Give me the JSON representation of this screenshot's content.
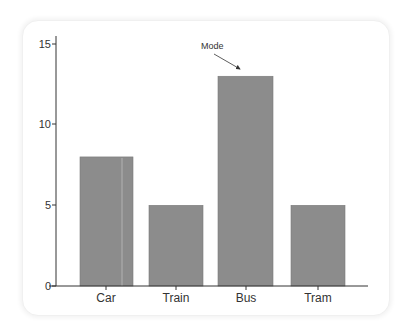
{
  "chart_data": {
    "type": "bar",
    "title": "",
    "xlabel": "",
    "ylabel": "",
    "categories": [
      "Car",
      "Train",
      "Bus",
      "Tram"
    ],
    "values": [
      8,
      5,
      13,
      5
    ],
    "ylim": [
      0,
      15
    ],
    "yticks": [
      0,
      5,
      10,
      15
    ],
    "grid": false,
    "legend": null,
    "bar_color": "#8c8c8c",
    "annotations": [
      {
        "text": "Mode",
        "target_category": "Bus",
        "target_value": 13,
        "arrow": true
      }
    ]
  },
  "axis": {
    "yticks": [
      "0",
      "5",
      "10",
      "15"
    ]
  },
  "labels": {
    "cat0": "Car",
    "cat1": "Train",
    "cat2": "Bus",
    "cat3": "Tram",
    "annotation": "Mode"
  }
}
